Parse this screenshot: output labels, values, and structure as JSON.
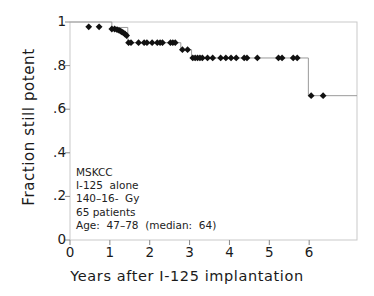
{
  "chart_data": {
    "type": "line",
    "title": "",
    "xlabel": "Years after  I-125  implantation",
    "ylabel": "Fraction  still  potent",
    "xlim": [
      0,
      7.2
    ],
    "ylim": [
      0,
      1.05
    ],
    "xticks": [
      0,
      1,
      2,
      3,
      4,
      5,
      6
    ],
    "xticklabels": [
      "0",
      "1",
      "2",
      "3",
      "4",
      "5",
      "6"
    ],
    "yticks": [
      0,
      0.2,
      0.4,
      0.6,
      0.8,
      1.0
    ],
    "yticklabels": [
      "0",
      ".2",
      ".4",
      ".6",
      ".8",
      "1"
    ],
    "grid": false,
    "legend": null,
    "series": [
      {
        "name": "Kaplan-Meier potency curve",
        "style": "step-post",
        "line_color": "#9a9a9a",
        "marker": "diamond",
        "marker_color": "#111111",
        "steps": [
          {
            "x": 0.0,
            "y": 1.0
          },
          {
            "x": 1.05,
            "y": 0.975
          },
          {
            "x": 1.45,
            "y": 0.905
          },
          {
            "x": 2.78,
            "y": 0.873
          },
          {
            "x": 3.05,
            "y": 0.835
          },
          {
            "x": 5.98,
            "y": 0.662
          },
          {
            "x": 7.2,
            "y": 0.662
          }
        ],
        "censored_points": [
          {
            "x": 0.47,
            "y": 0.978
          },
          {
            "x": 0.73,
            "y": 0.978
          },
          {
            "x": 1.05,
            "y": 0.968
          },
          {
            "x": 1.12,
            "y": 0.968
          },
          {
            "x": 1.18,
            "y": 0.965
          },
          {
            "x": 1.23,
            "y": 0.962
          },
          {
            "x": 1.27,
            "y": 0.958
          },
          {
            "x": 1.3,
            "y": 0.955
          },
          {
            "x": 1.34,
            "y": 0.95
          },
          {
            "x": 1.38,
            "y": 0.945
          },
          {
            "x": 1.42,
            "y": 0.938
          },
          {
            "x": 1.47,
            "y": 0.905
          },
          {
            "x": 1.53,
            "y": 0.905
          },
          {
            "x": 1.72,
            "y": 0.905
          },
          {
            "x": 1.86,
            "y": 0.905
          },
          {
            "x": 1.93,
            "y": 0.905
          },
          {
            "x": 2.06,
            "y": 0.905
          },
          {
            "x": 2.19,
            "y": 0.905
          },
          {
            "x": 2.26,
            "y": 0.905
          },
          {
            "x": 2.32,
            "y": 0.905
          },
          {
            "x": 2.52,
            "y": 0.905
          },
          {
            "x": 2.58,
            "y": 0.905
          },
          {
            "x": 2.64,
            "y": 0.905
          },
          {
            "x": 2.82,
            "y": 0.873
          },
          {
            "x": 2.95,
            "y": 0.873
          },
          {
            "x": 3.08,
            "y": 0.835
          },
          {
            "x": 3.14,
            "y": 0.835
          },
          {
            "x": 3.2,
            "y": 0.835
          },
          {
            "x": 3.26,
            "y": 0.835
          },
          {
            "x": 3.32,
            "y": 0.835
          },
          {
            "x": 3.45,
            "y": 0.835
          },
          {
            "x": 3.58,
            "y": 0.835
          },
          {
            "x": 3.78,
            "y": 0.835
          },
          {
            "x": 3.91,
            "y": 0.835
          },
          {
            "x": 4.04,
            "y": 0.835
          },
          {
            "x": 4.17,
            "y": 0.835
          },
          {
            "x": 4.37,
            "y": 0.835
          },
          {
            "x": 4.44,
            "y": 0.835
          },
          {
            "x": 4.7,
            "y": 0.835
          },
          {
            "x": 5.23,
            "y": 0.835
          },
          {
            "x": 5.32,
            "y": 0.835
          },
          {
            "x": 5.6,
            "y": 0.835
          },
          {
            "x": 5.7,
            "y": 0.835
          },
          {
            "x": 6.05,
            "y": 0.662
          },
          {
            "x": 6.35,
            "y": 0.662
          }
        ]
      }
    ],
    "annotation": {
      "lines": [
        "MSKCC",
        "I-125  alone",
        "140–16-  Gy",
        "65 patients",
        "Age:  47–78  (median:  64)"
      ]
    }
  }
}
